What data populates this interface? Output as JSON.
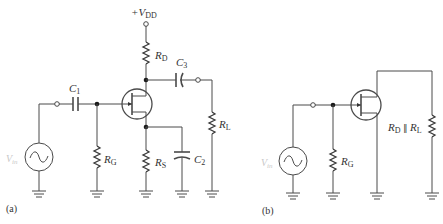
{
  "figure": {
    "part_a": {
      "caption": "(a)",
      "supply": {
        "prefix": "+V",
        "sub": "DD"
      },
      "source": {
        "main": "V",
        "sub": "in"
      },
      "C1": {
        "main": "C",
        "sub": "1"
      },
      "C2": {
        "main": "C",
        "sub": "2"
      },
      "C3": {
        "main": "C",
        "sub": "3"
      },
      "RG": {
        "main": "R",
        "sub": "G"
      },
      "RD": {
        "main": "R",
        "sub": "D"
      },
      "RS": {
        "main": "R",
        "sub": "S"
      },
      "RL": {
        "main": "R",
        "sub": "L"
      }
    },
    "part_b": {
      "caption": "(b)",
      "source": {
        "main": "V",
        "sub": "in"
      },
      "RG": {
        "main": "R",
        "sub": "G"
      },
      "RDRL": {
        "r1": "R",
        "r1sub": "D",
        "par": " ∥ ",
        "r2": "R",
        "r2sub": "L"
      }
    }
  },
  "colors": {
    "wire": "#4a4a4a",
    "source_label": "#c8c8c8",
    "background": "#ffffff"
  }
}
